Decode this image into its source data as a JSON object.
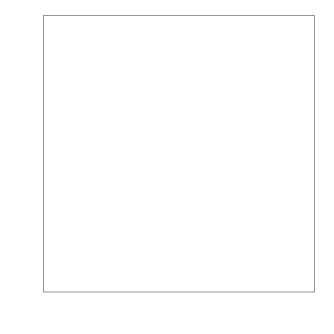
{
  "chart_data": {
    "type": "scatter",
    "title": "",
    "xlabel": "Normal percentiles",
    "ylabel": "y1",
    "xticklabels": [
      "0.01",
      "0.1",
      "1",
      "5",
      "10",
      "25",
      "50",
      "75",
      "90",
      "95",
      "99",
      "99.9",
      "99.99"
    ],
    "xtick_percentiles": [
      0.01,
      0.1,
      1,
      5,
      10,
      25,
      50,
      75,
      90,
      95,
      99,
      99.9,
      99.99
    ],
    "yticklabels": [
      "0",
      "50",
      "100",
      "150",
      "200",
      "250"
    ],
    "ytickvalues": [
      0,
      50,
      100,
      150,
      200,
      250
    ],
    "ylim": [
      0,
      250
    ],
    "xlim_percentile": [
      0.01,
      99.99
    ],
    "xscale": "normal-probability",
    "grid": false,
    "legend": null,
    "frame": "box",
    "series": [
      {
        "name": "sample quantiles",
        "marker": "dot",
        "color": "#111111",
        "points": [
          [
            0.09,
            0.3
          ],
          [
            0.14,
            0.4
          ],
          [
            0.19,
            0.4
          ],
          [
            0.26,
            0.5
          ],
          [
            0.33,
            0.5
          ],
          [
            0.4,
            0.6
          ],
          [
            0.48,
            0.6
          ],
          [
            0.56,
            0.7
          ],
          [
            0.65,
            0.7
          ],
          [
            0.74,
            0.8
          ],
          [
            0.84,
            0.8
          ],
          [
            0.95,
            0.9
          ],
          [
            1.06,
            0.9
          ],
          [
            1.2,
            1.0
          ],
          [
            1.4,
            1.0
          ],
          [
            1.6,
            1.1
          ],
          [
            1.9,
            1.1
          ],
          [
            2.2,
            1.2
          ],
          [
            2.6,
            1.2
          ],
          [
            3.0,
            1.3
          ],
          [
            3.5,
            1.3
          ],
          [
            4.0,
            1.4
          ],
          [
            4.6,
            1.4
          ],
          [
            5.3,
            1.5
          ],
          [
            6.0,
            1.5
          ],
          [
            6.8,
            1.6
          ],
          [
            7.7,
            1.6
          ],
          [
            8.7,
            1.7
          ],
          [
            9.8,
            1.7
          ],
          [
            11.0,
            1.8
          ],
          [
            12.3,
            1.8
          ],
          [
            13.7,
            1.9
          ],
          [
            15.2,
            1.9
          ],
          [
            16.8,
            2.0
          ],
          [
            18.5,
            2.0
          ],
          [
            20.3,
            2.1
          ],
          [
            22.2,
            2.1
          ],
          [
            24.2,
            2.2
          ],
          [
            26.3,
            2.3
          ],
          [
            28.5,
            2.4
          ],
          [
            30.8,
            2.5
          ],
          [
            33.2,
            2.6
          ],
          [
            35.7,
            2.8
          ],
          [
            38.3,
            3.0
          ],
          [
            41.0,
            3.2
          ],
          [
            43.8,
            3.5
          ],
          [
            46.7,
            3.8
          ],
          [
            49.7,
            4.2
          ],
          [
            52.8,
            4.6
          ],
          [
            55.5,
            5.1
          ],
          [
            58.2,
            5.6
          ],
          [
            60.8,
            6.2
          ],
          [
            63.3,
            6.8
          ],
          [
            65.7,
            7.4
          ],
          [
            68.0,
            8.1
          ],
          [
            70.2,
            8.8
          ],
          [
            72.3,
            9.5
          ],
          [
            74.3,
            10.3
          ],
          [
            76.2,
            11.1
          ],
          [
            78.0,
            12.0
          ],
          [
            79.7,
            12.9
          ],
          [
            81.3,
            13.8
          ],
          [
            82.8,
            14.8
          ],
          [
            84.2,
            15.8
          ],
          [
            85.5,
            16.9
          ],
          [
            86.7,
            18.0
          ],
          [
            87.8,
            19.2
          ],
          [
            88.8,
            20.4
          ],
          [
            89.8,
            21.7
          ],
          [
            90.7,
            23.0
          ],
          [
            91.5,
            24.3
          ],
          [
            92.3,
            25.5
          ],
          [
            93.0,
            26.6
          ],
          [
            93.6,
            27.6
          ],
          [
            94.2,
            28.3
          ],
          [
            94.8,
            28.9
          ],
          [
            95.3,
            29.4
          ],
          [
            95.8,
            30.2
          ],
          [
            96.2,
            31.2
          ],
          [
            96.6,
            32.6
          ],
          [
            96.9,
            34.4
          ],
          [
            97.2,
            36.6
          ],
          [
            97.5,
            39.0
          ],
          [
            97.7,
            41.5
          ],
          [
            97.9,
            44.0
          ],
          [
            98.1,
            47.0
          ],
          [
            98.3,
            50.5
          ],
          [
            98.45,
            53.5
          ],
          [
            98.6,
            56.5
          ],
          [
            98.75,
            59.5
          ],
          [
            98.9,
            62.5
          ],
          [
            99.0,
            65.0
          ],
          [
            99.1,
            67.5
          ],
          [
            99.2,
            70.0
          ],
          [
            99.3,
            72.5
          ],
          [
            99.4,
            75.5
          ],
          [
            99.48,
            78.5
          ],
          [
            99.55,
            81.0
          ],
          [
            99.62,
            83.5
          ],
          [
            99.68,
            85.5
          ],
          [
            99.73,
            87.0
          ],
          [
            99.78,
            88.0
          ],
          [
            99.86,
            124.0
          ],
          [
            99.9,
            135.0
          ],
          [
            99.93,
            147.0
          ],
          [
            99.975,
            223.0
          ]
        ]
      }
    ],
    "reference_line": {
      "name": "normal fit line",
      "color": "#6b6b6b",
      "width": 0.7,
      "start": [
        41.5,
        0.0
      ],
      "end": [
        99.99,
        57.5
      ]
    }
  },
  "axes": {
    "x_title": "Normal percentiles",
    "y_title": "y1"
  }
}
